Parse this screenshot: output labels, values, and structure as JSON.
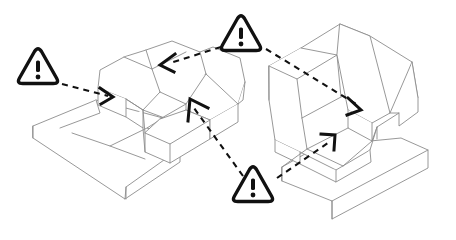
{
  "canvas": {
    "width": 456,
    "height": 240,
    "background": "#ffffff",
    "title": "Isometric CAD part comparison with warning callouts"
  },
  "style": {
    "part_line_color": "#8c8c8c",
    "part_line_color_dark": "#4a4a4a",
    "part_fill_color": "#ffffff",
    "leader_color": "#111111",
    "warning_outline_color": "#111111",
    "warning_fill_color": "#ffffff",
    "leader_dash_pattern": "6 5"
  },
  "parts": [
    {
      "name": "left-part",
      "label": "Left isometric part",
      "description": "Cross / plus-shaped extruded block with raised central boss and flat L base"
    },
    {
      "name": "right-part",
      "label": "Right isometric part",
      "description": "Pocketed block with angled ramp rib and flat L base"
    }
  ],
  "warnings": [
    {
      "id": "warning-1",
      "label": "!",
      "symbol": "warning-triangle",
      "x": 38,
      "y": 70,
      "size": 42,
      "targets": [
        "left-part-left-face"
      ]
    },
    {
      "id": "warning-2",
      "label": "!",
      "symbol": "warning-triangle",
      "x": 241,
      "y": 37,
      "size": 42,
      "targets": [
        "left-part-top-slot",
        "right-part-rib-top"
      ]
    },
    {
      "id": "warning-3",
      "label": "!",
      "symbol": "warning-triangle",
      "x": 253,
      "y": 188,
      "size": 42,
      "targets": [
        "left-part-center-boss",
        "right-part-lower-pocket"
      ]
    }
  ],
  "leaders": [
    {
      "name": "leader-w1-to-left-part",
      "from": "warning-1",
      "to": "left-part-left-face",
      "path": "M 62,84 L 108,96",
      "arrow": "M 100,88 L 113,97 L 101,104"
    },
    {
      "name": "leader-w2-to-left-part",
      "from": "warning-2",
      "to": "left-part-top-slot",
      "path": "M 221,47 L 170,63",
      "arrow": "M 175,54 L 160,65 L 174,72"
    },
    {
      "name": "leader-w2-to-right-part",
      "from": "warning-2",
      "to": "right-part-rib-top",
      "path": "M 266,49 L 356,104",
      "arrow": "M 348,98 L 361,110 L 347,115"
    },
    {
      "name": "leader-w3-to-left-part",
      "from": "warning-3",
      "to": "left-part-center-boss",
      "path": "M 243,176 L 194,108",
      "arrow": "M 188,121 L 190,99 L 208,108"
    },
    {
      "name": "leader-w3-to-right-part",
      "from": "warning-3",
      "to": "right-part-lower-pocket",
      "path": "M 277,178 L 328,143",
      "arrow": "M 321,134 L 335,135 L 334,150"
    }
  ]
}
